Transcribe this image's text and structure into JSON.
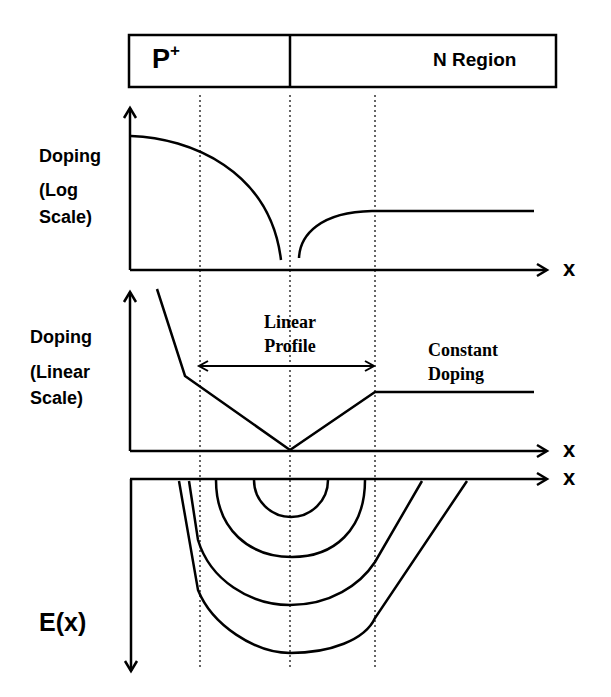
{
  "header_bar": {
    "p_region_label": "P",
    "p_region_superscript": "+",
    "n_region_label": "N Region"
  },
  "panels": [
    {
      "id": "doping-log",
      "ylabel_line1": "Doping",
      "ylabel_line2": "(Log",
      "ylabel_line3": "Scale)",
      "xlabel": "x"
    },
    {
      "id": "doping-linear",
      "ylabel_line1": "Doping",
      "ylabel_line2": "(Linear",
      "ylabel_line3": "Scale)",
      "xlabel": "x",
      "annotations": {
        "linear_profile_line1": "Linear",
        "linear_profile_line2": "Profile",
        "constant_doping_line1": "Constant",
        "constant_doping_line2": "Doping"
      }
    },
    {
      "id": "electric-field",
      "ylabel": "E(x)",
      "xlabel": "x"
    }
  ],
  "colors": {
    "stroke": "#000000",
    "background": "#ffffff"
  }
}
